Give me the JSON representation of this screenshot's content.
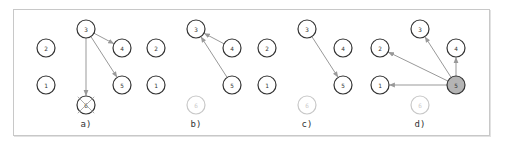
{
  "figure": {
    "panels": [
      {
        "label": "a)",
        "offset_x": 0,
        "nodes": [
          {
            "id": "1",
            "state": "normal"
          },
          {
            "id": "2",
            "state": "normal"
          },
          {
            "id": "3",
            "state": "normal"
          },
          {
            "id": "4",
            "state": "normal"
          },
          {
            "id": "5",
            "state": "normal"
          },
          {
            "id": "6",
            "state": "crossed"
          }
        ],
        "edges": [
          {
            "from": "3",
            "to": "4"
          },
          {
            "from": "3",
            "to": "5"
          },
          {
            "from": "3",
            "to": "6"
          }
        ]
      },
      {
        "label": "b)",
        "offset_x": 110,
        "nodes": [
          {
            "id": "1",
            "state": "normal"
          },
          {
            "id": "2",
            "state": "normal"
          },
          {
            "id": "3",
            "state": "normal"
          },
          {
            "id": "4",
            "state": "normal"
          },
          {
            "id": "5",
            "state": "normal"
          },
          {
            "id": "6",
            "state": "faded"
          }
        ],
        "edges": [
          {
            "from": "4",
            "to": "3"
          },
          {
            "from": "5",
            "to": "3"
          }
        ]
      },
      {
        "label": "c)",
        "offset_x": 221,
        "nodes": [
          {
            "id": "1",
            "state": "normal"
          },
          {
            "id": "2",
            "state": "normal"
          },
          {
            "id": "3",
            "state": "normal"
          },
          {
            "id": "4",
            "state": "normal"
          },
          {
            "id": "5",
            "state": "normal"
          },
          {
            "id": "6",
            "state": "faded"
          }
        ],
        "edges": [
          {
            "from": "3",
            "to": "5"
          }
        ]
      },
      {
        "label": "d)",
        "offset_x": 334,
        "nodes": [
          {
            "id": "1",
            "state": "normal"
          },
          {
            "id": "2",
            "state": "normal"
          },
          {
            "id": "3",
            "state": "normal"
          },
          {
            "id": "4",
            "state": "normal"
          },
          {
            "id": "5",
            "state": "active"
          },
          {
            "id": "6",
            "state": "faded"
          }
        ],
        "edges": [
          {
            "from": "5",
            "to": "1"
          },
          {
            "from": "5",
            "to": "2"
          },
          {
            "from": "5",
            "to": "3"
          },
          {
            "from": "5",
            "to": "4"
          }
        ]
      }
    ],
    "colors": {
      "node_stroke": "#333333",
      "faded_stroke": "#c8c8c8",
      "active_fill": "#b4b4b4",
      "edge": "#999999",
      "frame": "#c8c8c8"
    }
  }
}
